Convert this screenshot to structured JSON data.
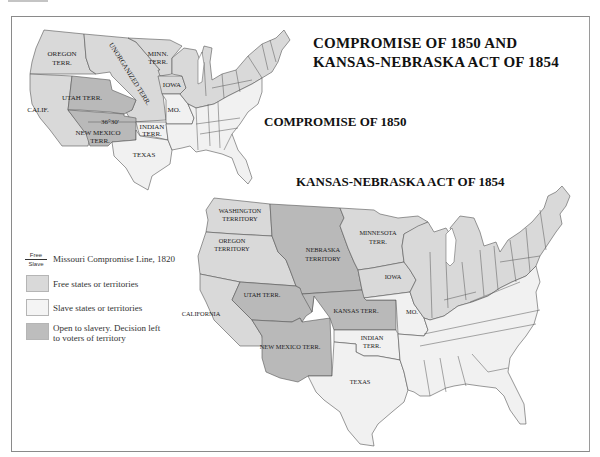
{
  "header": {
    "partial_top_text": "UNIT 4"
  },
  "title": {
    "line1": "COMPROMISE OF 1850 AND",
    "line2": "KANSAS-NEBRASKA ACT OF 1854"
  },
  "maps": [
    {
      "id": "compromise-1850",
      "caption": "COMPROMISE OF 1850",
      "labels": {
        "oregon1": "OREGON",
        "oregon2": "TERR.",
        "unorganized": "UNORGANIZED TERR.",
        "minn1": "MINN.",
        "minn2": "TERR.",
        "iowa": "IOWA",
        "utah": "UTAH TERR.",
        "calif": "CALIF.",
        "mo": "MO.",
        "line_label": "36°30'",
        "nm1": "NEW MEXICO",
        "nm2": "TERR.",
        "indian1": "INDIAN",
        "indian2": "TERR.",
        "texas": "TEXAS"
      }
    },
    {
      "id": "kansas-nebraska-1854",
      "caption": "KANSAS-NEBRASKA ACT OF 1854",
      "labels": {
        "wash1": "WASHINGTON",
        "wash2": "TERRITORY",
        "oregon1": "OREGON",
        "oregon2": "TERRITORY",
        "nebraska1": "NEBRASKA",
        "nebraska2": "TERRITORY",
        "minnesota1": "MINNESOTA",
        "minnesota2": "TERR.",
        "iowa": "IOWA",
        "utah": "UTAH TERR.",
        "california": "CALIFORNIA",
        "kansas": "KANSAS TERR.",
        "mo": "MO.",
        "nm": "NEW MEXICO TERR.",
        "indian1": "INDIAN",
        "indian2": "TERR.",
        "texas": "TEXAS"
      }
    }
  ],
  "legend": {
    "line_free": "Free",
    "line_slave": "Slave",
    "line_label": "Missouri Compromise Line, 1820",
    "items": [
      {
        "label": "Free states or territories",
        "color": "#d9d9d9"
      },
      {
        "label": "Slave states or territories",
        "color": "#f1f1f1"
      },
      {
        "label": "Open to slavery. Decision left",
        "label2": "to voters of territory",
        "color": "#b9b9b9"
      }
    ]
  },
  "colors": {
    "free": "#d9d9d9",
    "slave": "#f1f1f1",
    "open": "#b9b9b9",
    "border": "#555555"
  }
}
